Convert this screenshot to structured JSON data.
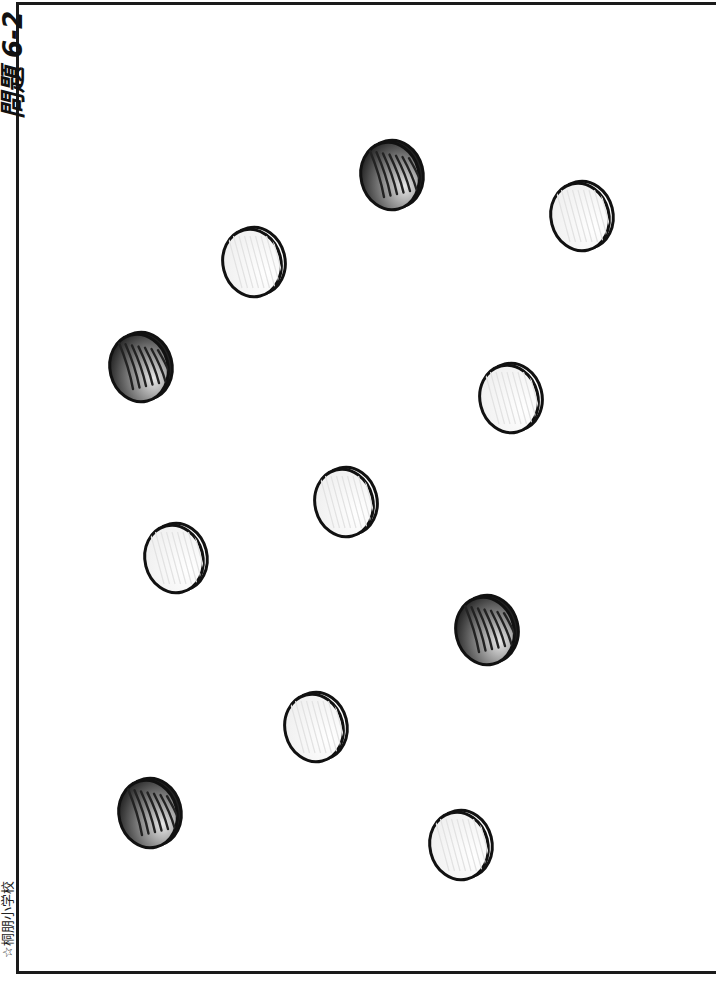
{
  "worksheet": {
    "title": "問題 6-2",
    "school_credit": "☆桐朋小学校"
  },
  "coins": [
    {
      "type": "white",
      "cx": 254,
      "cy": 262
    },
    {
      "type": "dark",
      "cx": 392,
      "cy": 175
    },
    {
      "type": "white",
      "cx": 582,
      "cy": 216
    },
    {
      "type": "dark",
      "cx": 141,
      "cy": 367
    },
    {
      "type": "white",
      "cx": 511,
      "cy": 398
    },
    {
      "type": "white",
      "cx": 346,
      "cy": 502
    },
    {
      "type": "white",
      "cx": 176,
      "cy": 558
    },
    {
      "type": "dark",
      "cx": 487,
      "cy": 630
    },
    {
      "type": "white",
      "cx": 316,
      "cy": 727
    },
    {
      "type": "dark",
      "cx": 150,
      "cy": 813
    },
    {
      "type": "white",
      "cx": 461,
      "cy": 845
    }
  ],
  "colors": {
    "outline": "#111111",
    "white_fill": "#f4f4f4",
    "dark_fill": "#555555"
  }
}
